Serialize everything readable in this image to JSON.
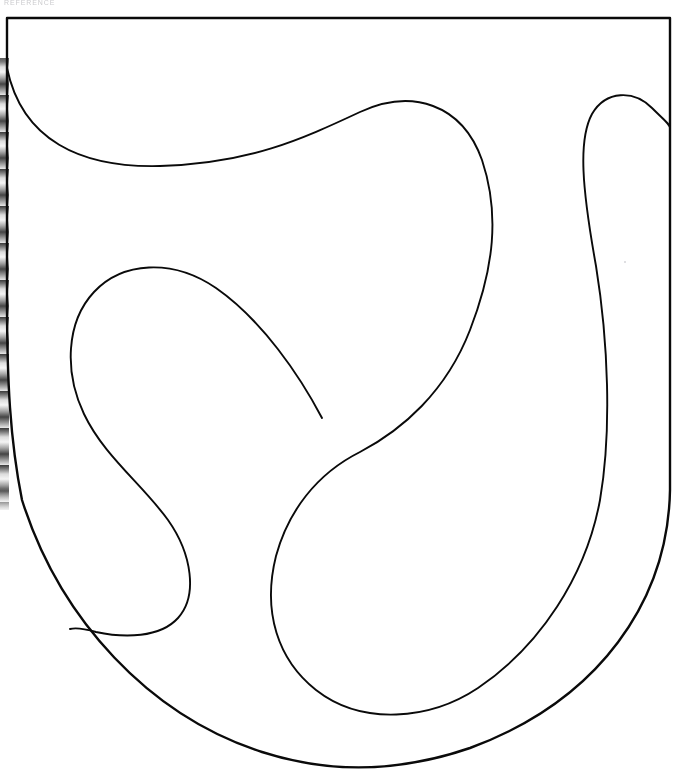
{
  "document": {
    "header_text": "REFERENCE",
    "title": "Heraldic shield outline with abstract curved partitions",
    "background_color": "#ffffff",
    "ink_color": "#0a0a0a",
    "page_width": 681,
    "page_height": 782
  },
  "artifacts": {
    "scan_edge_name": "scanner-binding-edge-strip",
    "dust_speck_name": "scanner-dust-speck",
    "dust_speck_color": "#d4d4d8"
  },
  "drawing": {
    "shield_outline": {
      "label": "Shield (escutcheon) outline",
      "stroke_width": 2.4,
      "path": "M 7 18 L 670 18 L 670 490 C 668 600 600 700 470 748 C 400 772 330 774 262 752 C 150 716 60 620 22 500 C 10 440 7 380 7 300 Z"
    },
    "partitions": [
      {
        "label": "Upper-left sweeping S curve from left border to right lobe",
        "stroke_width": 1.9,
        "path": "M 7 68 C 22 140 80 168 160 166 C 250 163 300 140 360 112 C 412 88 462 104 482 160 C 500 214 494 268 470 330 C 446 392 402 430 360 452 C 316 474 288 512 276 556 C 262 612 278 660 316 690 C 362 726 430 720 478 688 C 540 646 586 576 600 500 C 612 430 608 340 596 266 C 582 188 578 140 592 114 C 606 90 634 90 652 108 C 664 120 670 124 670 128"
      },
      {
        "label": "Central teardrop loop, left field, terminating at T-junction",
        "stroke_width": 1.9,
        "path": "M 322 418 C 300 376 262 320 216 288 C 172 258 122 262 94 292 C 66 322 64 372 84 414 C 104 456 142 484 168 520 C 192 554 198 596 178 618 C 160 638 124 638 96 632 C 82 628 74 628 70 629"
      }
    ]
  }
}
